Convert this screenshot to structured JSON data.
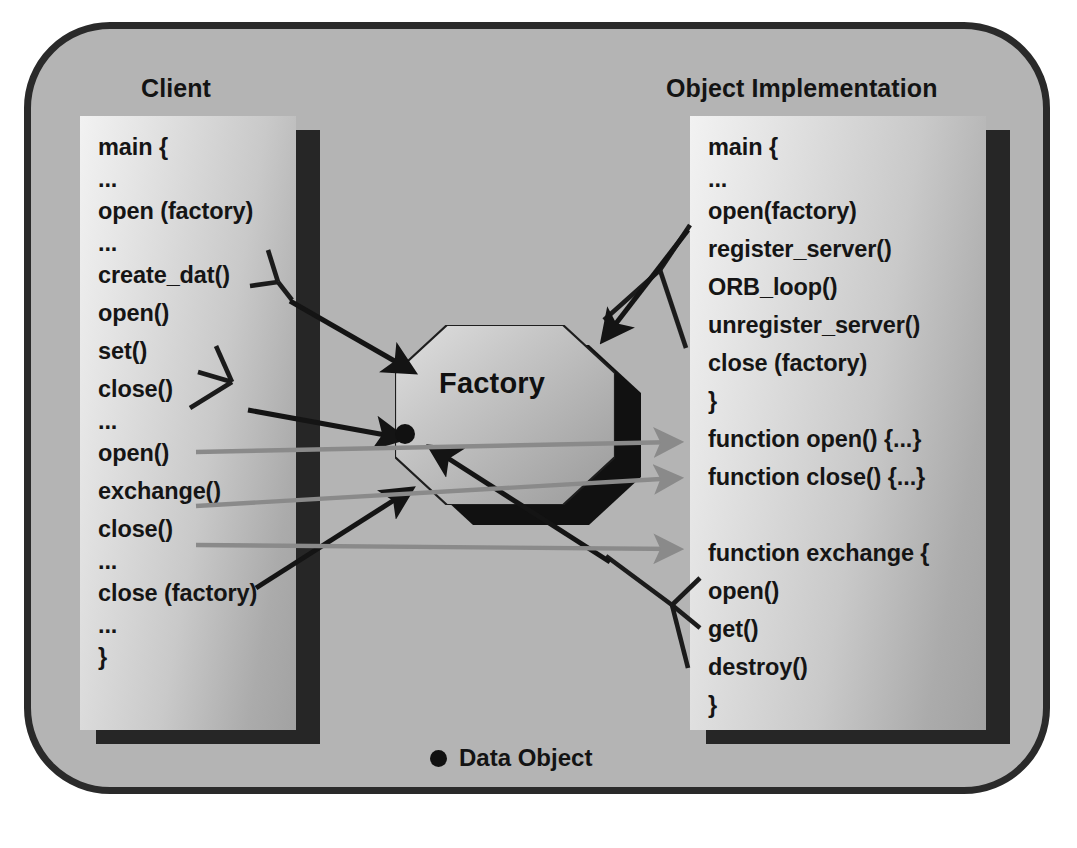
{
  "diagram": {
    "frame": {
      "background_color": "#b4b4b4",
      "border_color": "#2a2a2a"
    },
    "sections": {
      "client": {
        "title": "Client",
        "code_lines": [
          "main {",
          "...",
          "open (factory)",
          "...",
          "create_dat()",
          "open()",
          "set()",
          "close()",
          "...",
          "open()",
          "exchange()",
          "close()",
          "...",
          "close (factory)",
          "...",
          "}"
        ]
      },
      "object_implementation": {
        "title": "Object Implementation",
        "code_lines": [
          "main {",
          "...",
          "open(factory)",
          "register_server()",
          "ORB_loop()",
          "unregister_server()",
          "close (factory)",
          "}",
          "function open() {...}",
          "function close() {...}",
          "",
          "function exchange {",
          "open()",
          "get()",
          "destroy()",
          "}"
        ]
      }
    },
    "factory": {
      "label": "Factory",
      "shape": "octagon",
      "fill_light": "#cfcfcf",
      "fill_dark": "#9a9a9a",
      "shadow_color": "#111111",
      "data_object_marker": "data-object-dot"
    },
    "legend": {
      "marker": "filled-circle",
      "marker_color": "#111111",
      "label": "Data Object"
    },
    "connectors": {
      "black_arrow_color": "#141414",
      "gray_arrow_color": "#8a8a8a",
      "description": "Black arrows run from client and server call sites into the Factory octagon; gray arrows run from the Factory out to the server function definitions."
    }
  }
}
